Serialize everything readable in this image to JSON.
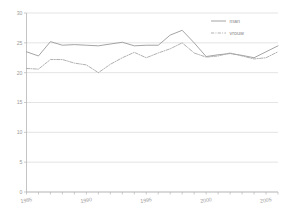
{
  "chart_data": {
    "type": "line",
    "title": "",
    "subtitle": "",
    "xlabel": "",
    "ylabel": "",
    "xlim": [
      1985,
      2006
    ],
    "ylim": [
      0,
      30
    ],
    "grid": true,
    "legend_position": "top-right",
    "x_ticks_labeled": [
      "1985",
      "1990",
      "1995",
      "2000",
      "2005"
    ],
    "y_ticks": [
      "0",
      "5",
      "10",
      "15",
      "20",
      "25",
      "30"
    ],
    "x": [
      1985,
      1986,
      1987,
      1988,
      1989,
      1990,
      1991,
      1992,
      1993,
      1994,
      1995,
      1996,
      1997,
      1998,
      1999,
      2000,
      2001,
      2002,
      2003,
      2004,
      2005,
      2006
    ],
    "series": [
      {
        "name": "man",
        "style": "solid",
        "color": "#9a9a9a",
        "values": [
          23.5,
          22.8,
          25.2,
          24.6,
          24.7,
          24.6,
          24.5,
          24.8,
          25.1,
          24.5,
          24.6,
          24.6,
          26.3,
          27.1,
          25.0,
          22.7,
          23.0,
          23.2,
          22.9,
          22.5,
          23.5,
          24.5
        ]
      },
      {
        "name": "vrouw",
        "style": "dash-dot",
        "color": "#a8a8a8",
        "values": [
          20.7,
          20.6,
          22.2,
          22.2,
          21.6,
          21.3,
          20.0,
          21.4,
          22.5,
          23.4,
          22.5,
          23.3,
          24.0,
          25.0,
          23.3,
          22.6,
          22.8,
          23.3,
          22.8,
          22.3,
          22.5,
          23.5
        ]
      }
    ]
  },
  "legend": {
    "items": [
      {
        "label": "man",
        "style": "solid"
      },
      {
        "label": "vrouw",
        "style": "dash-dot"
      }
    ]
  },
  "axes": {
    "y_tick_labels": [
      "30",
      "25",
      "20",
      "15",
      "10",
      "5",
      "0"
    ],
    "x_tick_labels": [
      "1985",
      "1990",
      "1995",
      "2000",
      "2005"
    ]
  },
  "colors": {
    "grid": "#d9d9d9",
    "axis": "#b5b5b5",
    "text": "#9b9b9b",
    "series_man": "#9a9a9a",
    "series_vrouw": "#a8a8a8",
    "background": "#ffffff"
  }
}
